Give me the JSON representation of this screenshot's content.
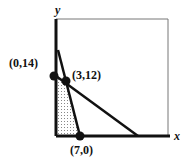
{
  "diagram": {
    "type": "feasible-region-graph",
    "axes": {
      "x_label": "x",
      "y_label": "y"
    },
    "points": [
      {
        "label": "(0,14)",
        "x": 0,
        "y": 14
      },
      {
        "label": "(3,12)",
        "x": 3,
        "y": 12
      },
      {
        "label": "(7,0)",
        "x": 7,
        "y": 0
      }
    ],
    "shaded_region": "polygon (0,0)-(0,14)-(3,12)-(7,0), dotted fill",
    "colors": {
      "line": "#111111",
      "frame": "#777777",
      "fill_dots": "#888888"
    }
  }
}
